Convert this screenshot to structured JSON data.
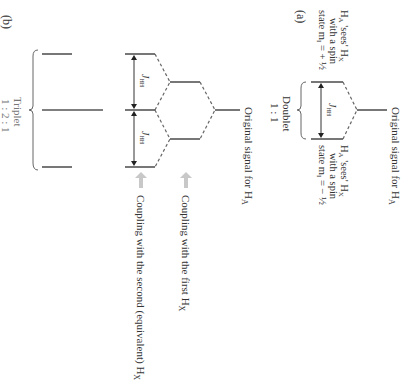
{
  "figure": {
    "orientation": "rotated 90deg clockwise",
    "panel_a": {
      "label": "(a)",
      "original_signal": "Original signal for H",
      "original_signal_sub": "A",
      "upper_state": {
        "line1": "H",
        "line1_sub": "A",
        "line1_rest": " 'sees' H",
        "line1_sub2": "X",
        "line2": "with a spin",
        "line3": "state m",
        "line3_sub": "I",
        "line3_rest": " = + ½"
      },
      "lower_state": {
        "line1": "H",
        "line1_sub": "A",
        "line1_rest": " 'sees' H",
        "line1_sub2": "X",
        "line2": "with a spin",
        "line3": "state m",
        "line3_sub": "I",
        "line3_rest": " = − ½"
      },
      "coupling_label": "J",
      "coupling_sub": "HH",
      "multiplet_name": "Doublet",
      "multiplet_ratio": "1 : 1"
    },
    "panel_b": {
      "label": "(b)",
      "original_signal": "Original signal for H",
      "original_signal_sub": "A",
      "coupling_label": "J",
      "coupling_sub": "HH",
      "arrow1_text": "Coupling with the first H",
      "arrow1_sub": "X",
      "arrow2_text": "Coupling with the second (equivalent) H",
      "arrow2_sub": "X",
      "multiplet_name": "Triplet",
      "multiplet_ratio": "1 : 2 : 1"
    },
    "colors": {
      "line": "#555555",
      "text": "#333333",
      "arrow_fill": "#c8c8c8",
      "triplet_text": "#777777"
    }
  }
}
